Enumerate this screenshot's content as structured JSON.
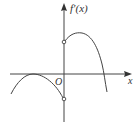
{
  "diagram": {
    "y_axis_label": "f′(x)",
    "x_axis_label": "x",
    "origin_label": "O",
    "colors": {
      "stroke": "#444444",
      "background": "#ffffff"
    },
    "features": {
      "left_branch": "downward parabola for x<0 touching x-axis at its maximum, ending at open circle below origin",
      "right_branch": "downward arc for x>0 starting at open circle above origin, crossing x-axis once",
      "open_circles": [
        "(0, positive)",
        "(0, negative)"
      ]
    }
  }
}
